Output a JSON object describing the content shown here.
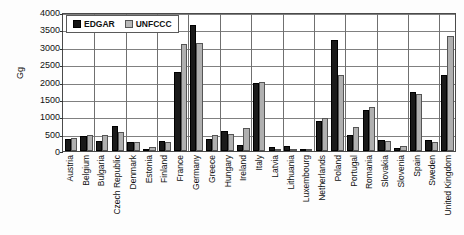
{
  "chart_data": {
    "type": "bar",
    "title": "",
    "xlabel": "",
    "ylabel": "Gg",
    "ylim": [
      0,
      4000
    ],
    "ytick_step": 500,
    "yticks": [
      "0",
      "500",
      "1000",
      "1500",
      "2000",
      "2500",
      "3000",
      "3500",
      "4000"
    ],
    "grid": true,
    "legend_position": "top-left-inside",
    "categories": [
      "Austria",
      "Belgium",
      "Bulgaria",
      "Czech Republic",
      "Denmark",
      "Estonia",
      "Finland",
      "France",
      "Germany",
      "Greece",
      "Hungary",
      "Ireland",
      "Italy",
      "Latvia",
      "Lithuania",
      "Luxembourg",
      "Netherlands",
      "Poland",
      "Portugal",
      "Romania",
      "Slovakia",
      "Slovenia",
      "Spain",
      "Sweden",
      "United Kingdom"
    ],
    "series": [
      {
        "name": "EDGAR",
        "color": "#1a1a1a",
        "values": [
          340,
          430,
          290,
          730,
          270,
          50,
          300,
          2270,
          3630,
          340,
          580,
          170,
          1950,
          110,
          150,
          20,
          850,
          3200,
          450,
          1180,
          310,
          100,
          1700,
          330,
          2180
        ]
      },
      {
        "name": "UNFCCC",
        "color": "#b0b0b0",
        "values": [
          370,
          450,
          450,
          560,
          260,
          110,
          250,
          3070,
          3100,
          450,
          500,
          650,
          2000,
          40,
          0,
          20,
          940,
          2200,
          700,
          1270,
          290,
          130,
          1650,
          270,
          3300
        ]
      }
    ]
  },
  "legend": {
    "items": [
      {
        "label": "EDGAR"
      },
      {
        "label": "UNFCCC"
      }
    ]
  },
  "axis": {
    "y_title": "Gg"
  }
}
